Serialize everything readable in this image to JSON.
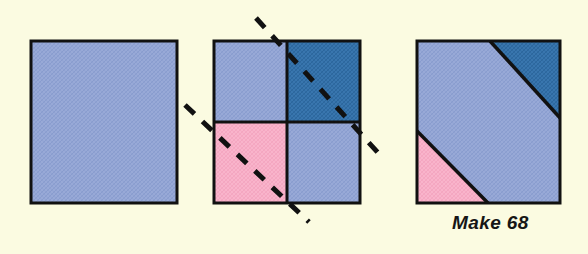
{
  "page": {
    "kind": "quilt-block-construction-diagram",
    "background_color": "#fbfbe1",
    "outline_color": "#111111"
  },
  "caption": {
    "text": "Make 68"
  },
  "palette": {
    "background": "#fbfbe1",
    "light_blue": "#8fa2d2",
    "dark_blue": "#2f6ca4",
    "pink": "#f6a9c3",
    "outline": "#111111",
    "dash": "#111111"
  },
  "legend": {
    "light_blue_label": "light blue print",
    "dark_blue_label": "dark blue print",
    "pink_label": "pink print"
  },
  "steps": [
    {
      "id": "step-1",
      "name": "single-light-blue-square",
      "label": "",
      "square": {
        "x": 31,
        "y": 41,
        "size": 146
      },
      "patches": [
        {
          "name": "full-square",
          "color_key": "light_blue"
        }
      ]
    },
    {
      "id": "step-2",
      "name": "four-patch-with-cut-lines",
      "label": "",
      "square": {
        "x": 214,
        "y": 41,
        "size": 146
      },
      "patches": [
        {
          "name": "top-left-quadrant",
          "color_key": "light_blue"
        },
        {
          "name": "top-right-quadrant",
          "color_key": "dark_blue"
        },
        {
          "name": "bottom-left-quadrant",
          "color_key": "pink"
        },
        {
          "name": "bottom-right-quadrant",
          "color_key": "light_blue"
        }
      ],
      "cut_lines": [
        {
          "name": "upper-diagonal-cut-line",
          "style": "dashed"
        },
        {
          "name": "lower-diagonal-cut-line",
          "style": "dashed"
        }
      ]
    },
    {
      "id": "step-3",
      "name": "finished-diagonal-band-block",
      "label": "",
      "square": {
        "x": 417,
        "y": 41,
        "size": 143
      },
      "patches": [
        {
          "name": "top-right-dark-blue-triangle",
          "color_key": "dark_blue"
        },
        {
          "name": "center-light-blue-band",
          "color_key": "light_blue"
        },
        {
          "name": "bottom-left-pink-triangle",
          "color_key": "pink"
        }
      ]
    }
  ]
}
